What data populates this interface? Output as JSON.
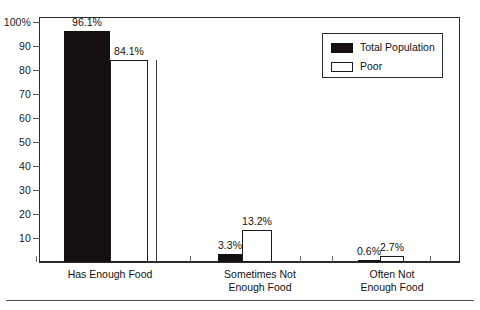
{
  "chart_data": {
    "type": "bar",
    "title": "",
    "subtitle": "",
    "xlabel": "",
    "ylabel": "",
    "ylim": [
      0,
      100
    ],
    "grid": false,
    "legend_position": "top-right",
    "categories": [
      "Has Enough Food",
      "Sometimes Not\nEnough Food",
      "Often Not\nEnough Food"
    ],
    "series": [
      {
        "name": "Total Population",
        "color": "#15100f",
        "values": [
          96.1,
          3.3,
          0.6
        ],
        "labels": [
          "96.1%",
          "3.3%",
          "0.6%"
        ]
      },
      {
        "name": "Poor",
        "color": "#ffffff",
        "values": [
          84.1,
          13.2,
          2.7
        ],
        "labels": [
          "84.1%",
          "13.2%",
          "2.7%"
        ]
      }
    ],
    "yticks": [
      100,
      90,
      80,
      70,
      60,
      50,
      40,
      30,
      20,
      10
    ],
    "ytick_labels": [
      "100%",
      "90",
      "80",
      "70",
      "60",
      "50",
      "40",
      "30",
      "20",
      "10"
    ]
  },
  "legend": {
    "items": [
      {
        "label": "Total Population",
        "swatch": "filled-black-swatch"
      },
      {
        "label": "Poor",
        "swatch": "outlined-white-swatch"
      }
    ]
  },
  "axes": {
    "y_axis_name": "percent-axis",
    "x_axis_name": "category-axis"
  }
}
